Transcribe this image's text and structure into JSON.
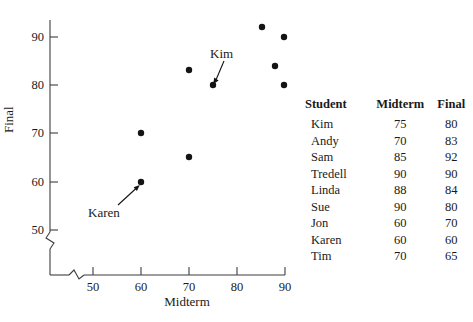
{
  "chart_data": {
    "type": "scatter",
    "title": "",
    "xlabel": "Midterm",
    "ylabel": "Final",
    "xlim": [
      45,
      92
    ],
    "ylim": [
      46,
      94
    ],
    "xticks": [
      50,
      60,
      70,
      80,
      90
    ],
    "yticks": [
      50,
      60,
      70,
      80,
      90
    ],
    "grid": false,
    "axis_break_x": true,
    "axis_break_y": true,
    "legend": "none",
    "points": [
      {
        "label": "Kim",
        "x": 75,
        "y": 80
      },
      {
        "label": "Andy",
        "x": 70,
        "y": 83
      },
      {
        "label": "Sam",
        "x": 85,
        "y": 92
      },
      {
        "label": "Tredell",
        "x": 90,
        "y": 90
      },
      {
        "label": "Linda",
        "x": 88,
        "y": 84
      },
      {
        "label": "Sue",
        "x": 90,
        "y": 80
      },
      {
        "label": "Jon",
        "x": 60,
        "y": 70
      },
      {
        "label": "Karen",
        "x": 60,
        "y": 60
      },
      {
        "label": "Tim",
        "x": 70,
        "y": 65
      }
    ],
    "annotations": [
      {
        "text": "Kim",
        "target_x": 75,
        "target_y": 80
      },
      {
        "text": "Karen",
        "target_x": 60,
        "target_y": 60
      }
    ],
    "point_color": "#141414",
    "axis_color": "#3d3d3d"
  },
  "axes": {
    "x_title": "Midterm",
    "y_title": "Final",
    "x_tick_labels": [
      "50",
      "60",
      "70",
      "80",
      "90"
    ],
    "y_tick_labels": [
      "50",
      "60",
      "70",
      "80",
      "90"
    ]
  },
  "callouts": {
    "kim": "Kim",
    "karen": "Karen"
  },
  "table": {
    "headers": [
      "Student",
      "Midterm",
      "Final"
    ],
    "rows": [
      [
        "Kim",
        "75",
        "80"
      ],
      [
        "Andy",
        "70",
        "83"
      ],
      [
        "Sam",
        "85",
        "92"
      ],
      [
        "Tredell",
        "90",
        "90"
      ],
      [
        "Linda",
        "88",
        "84"
      ],
      [
        "Sue",
        "90",
        "80"
      ],
      [
        "Jon",
        "60",
        "70"
      ],
      [
        "Karen",
        "60",
        "60"
      ],
      [
        "Tim",
        "70",
        "65"
      ]
    ]
  }
}
